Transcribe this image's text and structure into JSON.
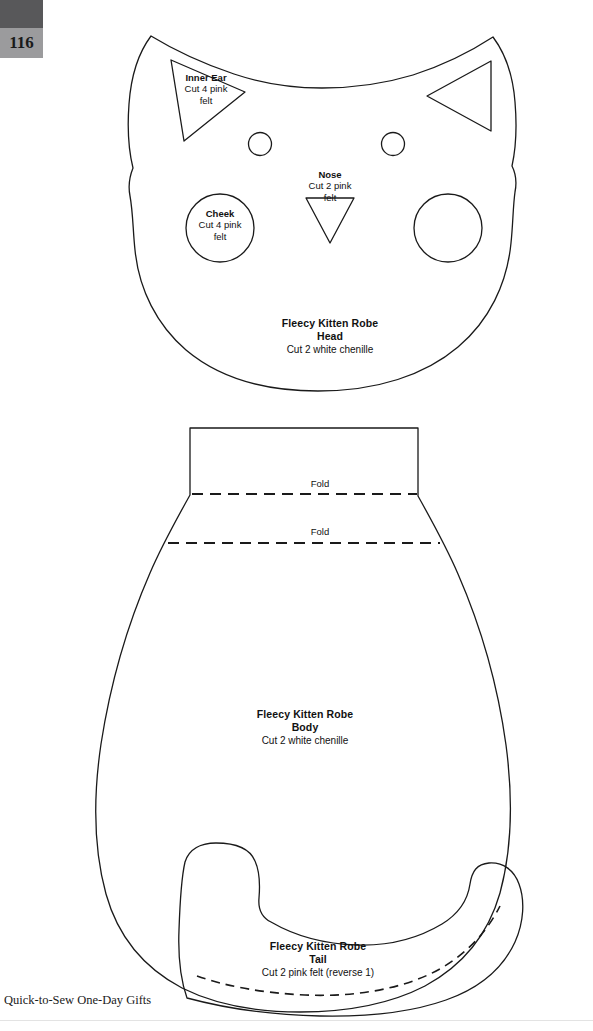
{
  "page": {
    "number": "116",
    "footer": "Quick-to-Sew One-Day Gifts",
    "background_color": "#ffffff",
    "ink_color": "#1a1a1a",
    "tab_dark_color": "#58585a",
    "tab_light_color": "#9b9b9d"
  },
  "pieces": {
    "inner_ear": {
      "name": "Inner Ear",
      "cut_line_1": "Cut 4 pink",
      "cut_line_2": "felt",
      "shape": "triangle-right"
    },
    "cheek": {
      "name": "Cheek",
      "cut_line_1": "Cut 4 pink",
      "cut_line_2": "felt",
      "shape": "circle"
    },
    "nose": {
      "name": "Nose",
      "cut_line_1": "Cut 2 pink",
      "cut_line_2": "felt",
      "shape": "triangle-down"
    },
    "head": {
      "title": "Fleecy Kitten Robe",
      "part": "Head",
      "cut": "Cut 2 white chenille",
      "shape": "cat-head-outline"
    },
    "body": {
      "title": "Fleecy Kitten Robe",
      "part": "Body",
      "cut": "Cut 2 white chenille",
      "shape": "body-outline"
    },
    "tail": {
      "title": "Fleecy Kitten Robe",
      "part": "Tail",
      "cut": "Cut 2 pink felt (reverse 1)",
      "shape": "tail-outline"
    }
  },
  "marks": {
    "fold_upper": "Fold",
    "fold_lower": "Fold"
  }
}
